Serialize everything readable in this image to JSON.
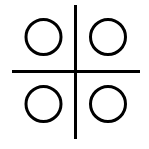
{
  "icon": {
    "name": "four-circles-quadrant-icon",
    "background": "#ffffff",
    "stroke_color": "#000000",
    "divider": {
      "vertical": {
        "x": 75.5,
        "y1": 5,
        "y2": 139,
        "width": 3
      },
      "horizontal": {
        "y": 71.5,
        "x1": 12,
        "x2": 140,
        "width": 3
      }
    },
    "circles": [
      {
        "position": "top-left",
        "cx": 43.5,
        "cy": 37,
        "r": 17.5,
        "stroke_width": 3
      },
      {
        "position": "top-right",
        "cx": 108,
        "cy": 37,
        "r": 17.5,
        "stroke_width": 3
      },
      {
        "position": "bottom-left",
        "cx": 43.5,
        "cy": 104,
        "r": 17.5,
        "stroke_width": 3
      },
      {
        "position": "bottom-right",
        "cx": 108,
        "cy": 104,
        "r": 17.5,
        "stroke_width": 3
      }
    ]
  }
}
